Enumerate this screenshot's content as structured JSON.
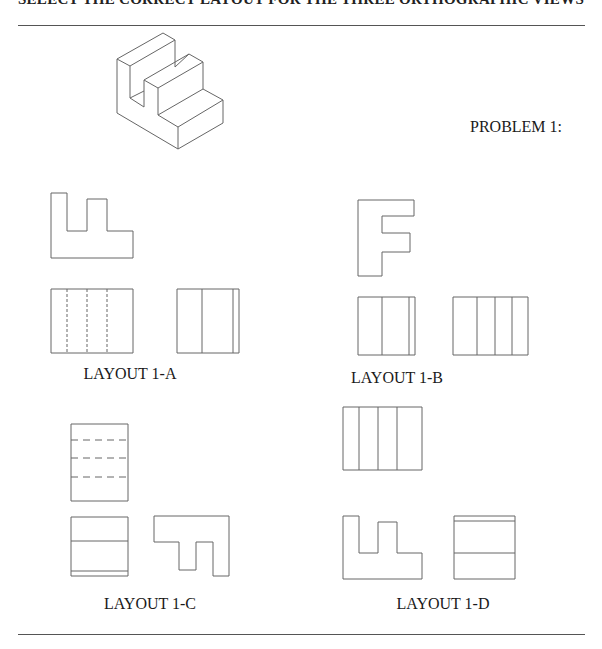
{
  "header": {
    "title": "SELECT THE CORRECT LAYOUT FOR THE THREE ORTHOGRAPHIC VIEWS"
  },
  "problem": {
    "label": "PROBLEM 1:"
  },
  "isometric": {
    "description": "isometric-stepped-block"
  },
  "layouts": [
    {
      "id": "1-A",
      "label": "LAYOUT 1-A"
    },
    {
      "id": "1-B",
      "label": "LAYOUT 1-B"
    },
    {
      "id": "1-C",
      "label": "LAYOUT 1-C"
    },
    {
      "id": "1-D",
      "label": "LAYOUT 1-D"
    }
  ],
  "colors": {
    "line": "#555555",
    "background": "#ffffff",
    "text": "#1a1a1a"
  }
}
